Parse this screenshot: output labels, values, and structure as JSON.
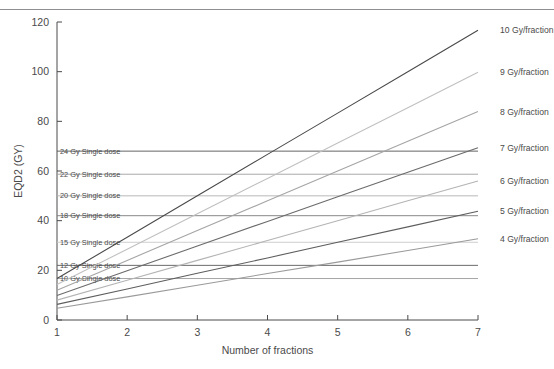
{
  "figure": {
    "axis_titles": {
      "x": "Number of fractions",
      "y": "EQD2 (GY)"
    }
  },
  "chart_data": {
    "type": "line",
    "title": "",
    "xlabel": "Number of fractions",
    "ylabel": "EQD2 (GY)",
    "xlim": [
      1,
      7
    ],
    "ylim": [
      0,
      120
    ],
    "xticks": [
      1,
      2,
      3,
      4,
      5,
      6,
      7
    ],
    "xtick_labels": [
      "1",
      "2",
      "3",
      "4",
      "5",
      "6",
      "7"
    ],
    "yticks": [
      0,
      20,
      40,
      60,
      80,
      100,
      120
    ],
    "ytick_labels": [
      "0",
      "20",
      "40",
      "60",
      "80",
      "100",
      "120"
    ],
    "grid": false,
    "legend_position": "right-inline-labels",
    "x": [
      1,
      2,
      3,
      4,
      5,
      6,
      7
    ],
    "series": [
      {
        "name": "4 Gy/fraction",
        "label": "4 Gy/fraction",
        "color": "#9a9a9a",
        "values": [
          4.7,
          9.3,
          14.0,
          18.7,
          23.3,
          28.0,
          32.7
        ]
      },
      {
        "name": "5 Gy/fraction",
        "label": "5 Gy/fraction",
        "color": "#5e5e5e",
        "values": [
          6.3,
          12.5,
          18.8,
          25.0,
          31.3,
          37.5,
          43.8
        ]
      },
      {
        "name": "6 Gy/fraction",
        "label": "6 Gy/fraction",
        "color": "#b4b4b4",
        "values": [
          8.0,
          16.0,
          24.0,
          32.0,
          40.0,
          48.0,
          56.0
        ]
      },
      {
        "name": "7 Gy/fraction",
        "label": "7 Gy/fraction",
        "color": "#6b6b6b",
        "values": [
          9.9,
          19.8,
          29.8,
          39.7,
          49.6,
          59.5,
          69.4
        ]
      },
      {
        "name": "8 Gy/fraction",
        "label": "8 Gy/fraction",
        "color": "#a5a5a5",
        "values": [
          12.0,
          24.0,
          36.0,
          48.0,
          60.0,
          72.0,
          84.0
        ]
      },
      {
        "name": "9 Gy/fraction",
        "label": "9 Gy/fraction",
        "color": "#c0c0c0",
        "values": [
          14.3,
          28.5,
          42.8,
          57.0,
          71.3,
          85.5,
          99.8
        ]
      },
      {
        "name": "10 Gy/fraction",
        "label": "10 Gy/fraction",
        "color": "#4a4a4a",
        "values": [
          16.7,
          33.3,
          50.0,
          66.7,
          83.3,
          100.0,
          116.7
        ]
      }
    ],
    "reference_lines": [
      {
        "label": "10 Gy Single dose",
        "value": 16.7,
        "color": "#9c9c9c"
      },
      {
        "label": "12 Gy Single dose",
        "value": 22.0,
        "color": "#5a5a5a"
      },
      {
        "label": "15 Gy Single dose",
        "value": 31.3,
        "color": "#c8c8c8"
      },
      {
        "label": "18 Gy Single dose",
        "value": 42.0,
        "color": "#7a7a7a"
      },
      {
        "label": "20 Gy Single dose",
        "value": 50.0,
        "color": "#b0b0b0"
      },
      {
        "label": "22 Gy Single dose",
        "value": 58.7,
        "color": "#9f9f9f"
      },
      {
        "label": "24 Gy Single dose",
        "value": 68.0,
        "color": "#555555"
      }
    ]
  }
}
